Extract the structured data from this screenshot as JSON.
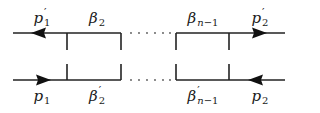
{
  "diagram": {
    "type": "ladder-diagram",
    "colors": {
      "line": "#222222",
      "background": "#ffffff",
      "dots": "#555555"
    },
    "top_labels": [
      {
        "id": "p1-prime",
        "base": "p",
        "prime": "′",
        "sub": "1"
      },
      {
        "id": "beta-2",
        "base": "β",
        "prime": "",
        "sub": "2"
      },
      {
        "id": "beta-n-1",
        "base": "β",
        "prime": "",
        "sub_var": "n",
        "sub_rest": "−1"
      },
      {
        "id": "p2-prime",
        "base": "p",
        "prime": "′",
        "sub": "2"
      }
    ],
    "bottom_labels": [
      {
        "id": "p1",
        "base": "p",
        "prime": "",
        "sub": "1"
      },
      {
        "id": "beta-2-prime",
        "base": "β",
        "prime": "′",
        "sub": "2"
      },
      {
        "id": "beta-n-1-prime",
        "base": "β",
        "prime": "′",
        "sub_var": "n",
        "sub_rest": "−1"
      },
      {
        "id": "p2",
        "base": "p",
        "prime": "",
        "sub": "2"
      }
    ],
    "ellipsis": "· · · · · ·",
    "arrows": {
      "top_left": "left",
      "top_right": "right",
      "bottom_left": "right",
      "bottom_right": "left"
    }
  }
}
